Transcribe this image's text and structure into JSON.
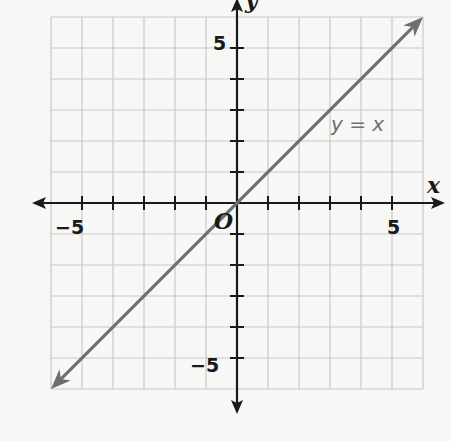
{
  "chart_data": {
    "type": "line",
    "title": "",
    "xlabel": "x",
    "ylabel": "y",
    "xlim": [
      -6,
      6
    ],
    "ylim": [
      -6,
      6
    ],
    "grid": true,
    "grid_step": 1,
    "x_tick_labels": [
      {
        "value": -5,
        "label": "−5"
      },
      {
        "value": 5,
        "label": "5"
      }
    ],
    "y_tick_labels": [
      {
        "value": 5,
        "label": "5"
      },
      {
        "value": -5,
        "label": "−5"
      }
    ],
    "origin_label": "O",
    "series": [
      {
        "name": "y = x",
        "equation": "y = x",
        "x": [
          -6,
          6
        ],
        "y": [
          -6,
          6
        ],
        "arrows": "both",
        "color": "#6e6e6e",
        "label_position": {
          "x": 3.5,
          "y": 2.5
        }
      }
    ],
    "legend": null
  },
  "labels": {
    "x_axis": "x",
    "y_axis": "y",
    "origin": "O",
    "line": "y = x",
    "x_neg5": "−5",
    "x_pos5": "5",
    "y_pos5": "5",
    "y_neg5": "−5"
  },
  "colors": {
    "background": "#f7f7f5",
    "grid": "#c8c8c8",
    "axis": "#1a1a1a",
    "line": "#6e6e6e"
  }
}
